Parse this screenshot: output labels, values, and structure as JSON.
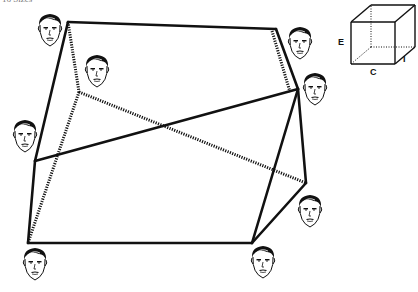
{
  "header": {
    "cut_text": "16     Sizes"
  },
  "cube_legend": {
    "labels": [
      {
        "id": "E",
        "text": "E",
        "x": 338,
        "y": 37
      },
      {
        "id": "C",
        "text": "C",
        "x": 370,
        "y": 67
      },
      {
        "id": "I",
        "text": "I",
        "x": 403,
        "y": 54
      }
    ],
    "front": [
      [
        351,
        22
      ],
      [
        395,
        22
      ],
      [
        395,
        64
      ],
      [
        351,
        64
      ]
    ],
    "back": [
      [
        371,
        5
      ],
      [
        415,
        5
      ],
      [
        415,
        47
      ],
      [
        371,
        47
      ]
    ]
  },
  "diagram": {
    "vertices": {
      "A": [
        68,
        22
      ],
      "B": [
        276,
        29
      ],
      "C": [
        79,
        92
      ],
      "D": [
        298,
        89
      ],
      "E": [
        35,
        161
      ],
      "F": [
        306,
        183
      ],
      "G": [
        28,
        243
      ],
      "H": [
        252,
        243
      ]
    },
    "solid_edges": [
      [
        "A",
        "B"
      ],
      [
        "A",
        "E"
      ],
      [
        "B",
        "D"
      ],
      [
        "E",
        "D"
      ],
      [
        "E",
        "G"
      ],
      [
        "G",
        "H"
      ],
      [
        "H",
        "D"
      ],
      [
        "H",
        "F"
      ],
      [
        "F",
        "D"
      ]
    ],
    "dotted_edges": [
      [
        "A",
        "C"
      ],
      [
        "B",
        "D"
      ],
      [
        "C",
        "F"
      ],
      [
        "C",
        "G"
      ]
    ],
    "faces": [
      {
        "id": "face-top-left",
        "x": 35,
        "y": 11
      },
      {
        "id": "face-inner-upper",
        "x": 82,
        "y": 52
      },
      {
        "id": "face-top-right",
        "x": 285,
        "y": 24
      },
      {
        "id": "face-right-middle",
        "x": 300,
        "y": 70
      },
      {
        "id": "face-left-middle",
        "x": 10,
        "y": 117
      },
      {
        "id": "face-lower-right",
        "x": 295,
        "y": 192
      },
      {
        "id": "face-bottom-left",
        "x": 20,
        "y": 245
      },
      {
        "id": "face-bottom-right",
        "x": 248,
        "y": 243
      }
    ]
  },
  "colors": {
    "line": "#111111",
    "background": "#ffffff"
  }
}
